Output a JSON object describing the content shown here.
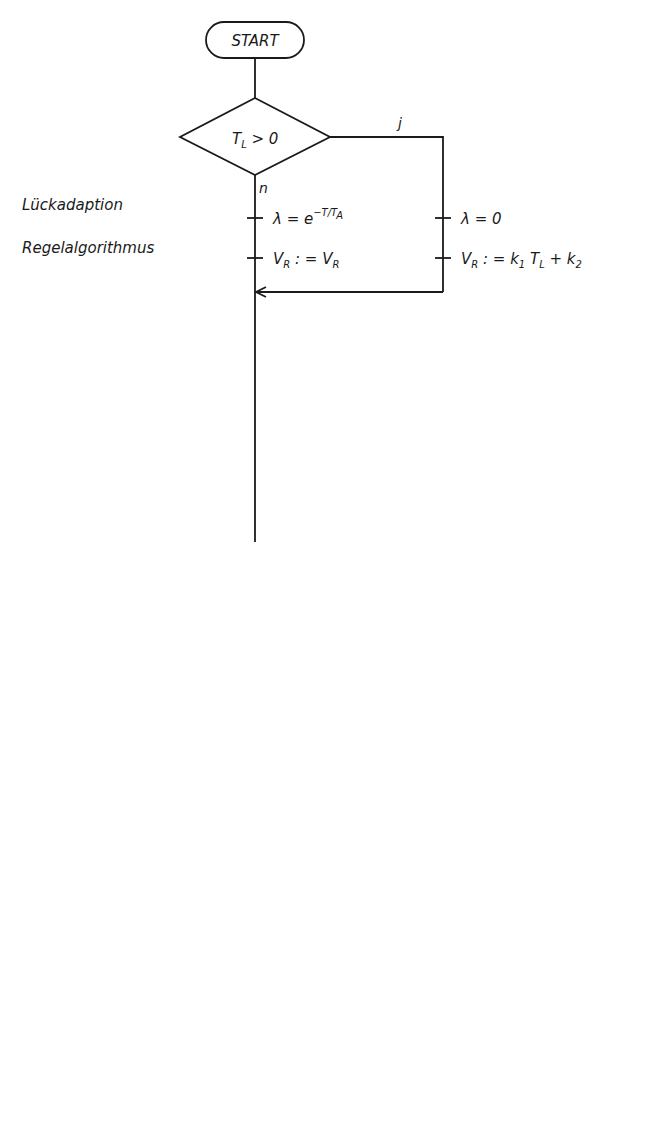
{
  "terminals": {
    "start": "START",
    "end": "Return"
  },
  "sections": {
    "lueckadaption": "Lückadaption",
    "regelalgorithmus": "Regelalgorithmus",
    "anstiegsbegrenzung": "Anstiegsbegrenzung",
    "stellgroessen_1": "Stellgrößen-",
    "stellgroessen_2": "begrenzung",
    "korrektur_1": "Korrektur der",
    "korrektur_2": "Regelabweichung"
  },
  "branch_labels": {
    "yes": "j",
    "no": "n"
  },
  "decisions": [
    {
      "id": "d1",
      "text": "T_L > 0"
    },
    {
      "id": "d2",
      "text": "Δy > 60°"
    },
    {
      "id": "d3",
      "text": "Δy < −60°"
    },
    {
      "id": "d4",
      "text": "y_k1(k) > Y_max"
    },
    {
      "id": "d5",
      "text": "y_k1(k) < Y_min"
    }
  ],
  "steps": {
    "lambda_exp": "λ = e^(−T/T_A)",
    "vr_keep": "V_R : = V_R",
    "lambda_zero": "λ = 0",
    "vr_set": "V_R : = k_1 T_L + k_2",
    "s1": "y(k−3) : = y(k−2)",
    "s2": "y(k−2) : = y(k−1)",
    "s3": "y(k−1) : = y(k)",
    "s4": "x_W(k−2) : = x_W(k−1)",
    "s5": "x_W(k−1) : = x_W(k)",
    "s6": "x_W(k) : = V_R·(w(k) − x(k))",
    "s7": "y(k) = y(k−2) + x_W(k) − λ x_W(k−1)",
    "s8a": "Δy = y(k−2) − y(k−3) + x_W(k) − x_W(k−1)",
    "s8b": "− λ x_W(k−1) + λ x_W(k−2)",
    "yk1_plus": "y_k1(k) : = y(k−1) + 60°",
    "yk1_minus": "y_k1(k) = y(k−1) − 60°",
    "yk1_eq": "y_k1(k) = y(k)",
    "yk2_max": "y_k2(k) : = Y_max",
    "yk2_min": "y_k2(k) : = Y_min",
    "yk2_eq": "y_k2(k) = y(k)",
    "xwk": "x_wk(k) : = x_W(k) + y_k2(k) − y_k1(k)",
    "ausgabe": "Ausgabe y_k2(k)"
  },
  "render": {
    "d1": {
      "main": "T",
      "sub": "L",
      "rest": " > 0"
    },
    "d2": {
      "main": "Δy > 60°"
    },
    "d3": {
      "main": "Δy < −60°"
    },
    "d4": {
      "a": "y",
      "sub": "k1",
      "b": "(k) > Y",
      "sub2": "max"
    },
    "d5": {
      "a": "y",
      "sub": "k1",
      "b": "(k) < Y",
      "sub2": "min"
    },
    "lambda_exp": {
      "a": "λ = e",
      "sup": "−T/T",
      "supsub": "A"
    },
    "vr_keep": {
      "a": "V",
      "sub": "R",
      "b": " : = V",
      "sub2": "R"
    },
    "lambda_zero": {
      "a": "λ = 0"
    },
    "vr_set": {
      "a": "V",
      "sub": "R",
      "b": " : = k",
      "sub2": "1",
      "c": " T",
      "sub3": "L",
      "d": " + k",
      "sub4": "2"
    },
    "s1": {
      "a": "y(k−3) : = y(k−2)"
    },
    "s2": {
      "a": "y(k−2) : = y(k−1)"
    },
    "s3": {
      "a": "y(k−1) : = y(k)"
    },
    "s4": {
      "a": "x",
      "sub": "W",
      "b": "(k−2) : = x",
      "sub2": "W",
      "c": "(k−1)"
    },
    "s5": {
      "a": "x",
      "sub": "W",
      "b": "(k−1) : = x",
      "sub2": "W",
      "c": "(k)"
    },
    "s6": {
      "a": "x",
      "sub": "W",
      "b": "(k) : = V",
      "sub2": "R",
      "c": "·(w(k) − x(k))"
    },
    "s7": {
      "a": "y(k) = y(k−2) + x",
      "sub": "W",
      "b": "(k) − λx",
      "sub2": "W",
      "c": "(k−1)"
    },
    "s8a": {
      "a": "Δy = y(k−2) − y(k−3) + x",
      "sub": "W",
      "b": "(k) − x",
      "sub2": "W",
      "c": "(k−1)"
    },
    "s8b": {
      "a": "−λx",
      "sub": "W",
      "b": "(k−1) + λx",
      "sub2": "W",
      "c": "(k−2)"
    },
    "yk1_plus": {
      "a": "y",
      "sub": "k1",
      "b": "(k) : = y(k−1) + 60°"
    },
    "yk1_minus": {
      "a": "y",
      "sub": "k1",
      "b": "(k) = y(k−1) − 60°"
    },
    "yk1_eq": {
      "a": "y",
      "sub": "k1",
      "b": "(k) = y(k)"
    },
    "yk2_max": {
      "a": "y",
      "sub": "k2",
      "b": "(k) : = Y",
      "sub2": "max"
    },
    "yk2_min": {
      "a": "y",
      "sub": "k2",
      "b": "(k) : = Y",
      "sub2": "min"
    },
    "yk2_eq": {
      "a": "y",
      "sub": "k2",
      "b": "(k) = y(k)"
    },
    "xwk": {
      "a": "x",
      "sub": "wk",
      "b": "(k) : = x",
      "sub2": "W",
      "c": "(k) + y",
      "sub3": "k2",
      "d": "(k) − y",
      "sub4": "k1",
      "e": "(k)"
    },
    "ausgabe": {
      "a": "Ausgabe  y",
      "sub": "k2",
      "b": "(k)"
    }
  }
}
